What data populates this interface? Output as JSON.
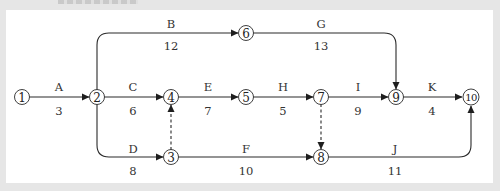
{
  "diagram": {
    "type": "activity-on-arrow network",
    "background_color": "#e6e6e6",
    "panel_color": "#ffffff",
    "line_color": "#2b2b2b",
    "nodes": [
      {
        "id": "1",
        "label": "1",
        "x": 22,
        "y": 97
      },
      {
        "id": "2",
        "label": "2",
        "x": 97,
        "y": 97
      },
      {
        "id": "3",
        "label": "3",
        "x": 171,
        "y": 157
      },
      {
        "id": "4",
        "label": "4",
        "x": 171,
        "y": 97
      },
      {
        "id": "5",
        "label": "5",
        "x": 246,
        "y": 97
      },
      {
        "id": "6",
        "label": "6",
        "x": 246,
        "y": 33
      },
      {
        "id": "7",
        "label": "7",
        "x": 321,
        "y": 97
      },
      {
        "id": "8",
        "label": "8",
        "x": 321,
        "y": 157
      },
      {
        "id": "9",
        "label": "9",
        "x": 396,
        "y": 97
      },
      {
        "id": "10",
        "label": "10",
        "x": 471,
        "y": 97
      }
    ],
    "activities": [
      {
        "name": "A",
        "duration": "3",
        "from": "1",
        "to": "2"
      },
      {
        "name": "B",
        "duration": "12",
        "from": "2",
        "to": "6"
      },
      {
        "name": "C",
        "duration": "6",
        "from": "2",
        "to": "4"
      },
      {
        "name": "D",
        "duration": "8",
        "from": "2",
        "to": "3"
      },
      {
        "name": "E",
        "duration": "7",
        "from": "4",
        "to": "5"
      },
      {
        "name": "F",
        "duration": "10",
        "from": "3",
        "to": "8"
      },
      {
        "name": "G",
        "duration": "13",
        "from": "6",
        "to": "9"
      },
      {
        "name": "H",
        "duration": "5",
        "from": "5",
        "to": "7"
      },
      {
        "name": "I",
        "duration": "9",
        "from": "7",
        "to": "9"
      },
      {
        "name": "J",
        "duration": "11",
        "from": "8",
        "to": "10"
      },
      {
        "name": "K",
        "duration": "4",
        "from": "9",
        "to": "10"
      }
    ],
    "dummies": [
      {
        "from": "3",
        "to": "4"
      },
      {
        "from": "7",
        "to": "8"
      }
    ]
  }
}
